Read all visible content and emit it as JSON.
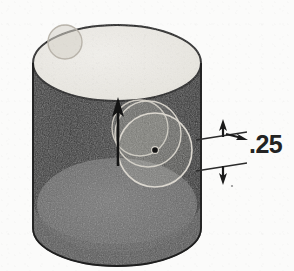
{
  "diagram": {
    "type": "3d-cad-extrude-preview",
    "background_color": "#fbfbfa"
  },
  "dimension": {
    "value": ".25",
    "label_name": "extrude-depth-dimension",
    "arrow_direction": "right",
    "extension_line_top_y": 138,
    "extension_line_bottom_y": 163,
    "witness_arrow_up": "up-arrow",
    "witness_arrow_down": "down-arrow"
  },
  "solid": {
    "name": "cylinder",
    "top_face_color": "#eceae5",
    "side_color": "#3a3a3a",
    "bottom_face_color": "#6e6e6e",
    "outline_color": "#2a2a2a",
    "center_x": 117,
    "top_ellipse_cy": 63,
    "bottom_ellipse_cy": 228,
    "rx": 84,
    "ry": 38
  },
  "features": {
    "extrude_arrow": {
      "name": "extrude-direction-arrow",
      "direction": "up",
      "x": 118,
      "tail_y": 164,
      "tip_y": 100,
      "color": "#1e1e1e"
    },
    "sketch_circles": [
      {
        "name": "sketch-circle-main",
        "cx": 155,
        "cy": 150,
        "r": 37,
        "color": "#d8d4cc"
      },
      {
        "name": "sketch-circle-secondary",
        "cx": 148,
        "cy": 134,
        "r": 33,
        "color": "#cfcbc3"
      },
      {
        "name": "sketch-circle-construction",
        "cx": 140,
        "cy": 128,
        "r": 28,
        "color": "#c6c2ba"
      },
      {
        "name": "sketch-circle-rim",
        "cx": 65,
        "cy": 42,
        "r": 17,
        "color": "#cbc7c0"
      }
    ],
    "center_point": {
      "name": "sketch-center-point",
      "cx": 155,
      "cy": 150,
      "r": 3,
      "color": "#1c1c1c"
    }
  }
}
